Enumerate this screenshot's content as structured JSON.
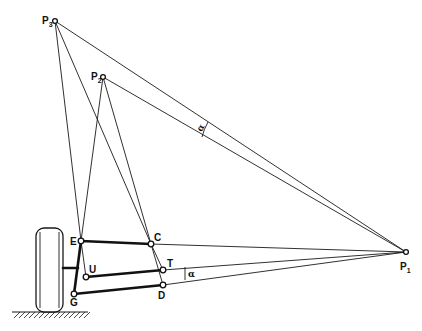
{
  "diagram": {
    "type": "suspension-linkage-geometry",
    "points": {
      "P1": {
        "label": "P",
        "sub": "1",
        "x": 406,
        "y": 252
      },
      "P2": {
        "label": "P",
        "sub": "2",
        "x": 103,
        "y": 77
      },
      "P3": {
        "label": "P",
        "sub": "3",
        "x": 55,
        "y": 21
      },
      "E": {
        "label": "E",
        "x": 81,
        "y": 241
      },
      "C": {
        "label": "C",
        "x": 151,
        "y": 244
      },
      "U": {
        "label": "U",
        "x": 86,
        "y": 277
      },
      "T": {
        "label": "T",
        "x": 163,
        "y": 270
      },
      "G": {
        "label": "G",
        "x": 74,
        "y": 294
      },
      "D": {
        "label": "D",
        "x": 163,
        "y": 285
      }
    },
    "links": [
      {
        "from": "E",
        "to": "C",
        "style": "thick"
      },
      {
        "from": "U",
        "to": "T",
        "style": "thick"
      },
      {
        "from": "G",
        "to": "D",
        "style": "thick"
      },
      {
        "from": "E",
        "to": "G",
        "style": "thick"
      }
    ],
    "construction_lines": [
      {
        "from": "P3",
        "to": "P1"
      },
      {
        "from": "P2",
        "to": "P1"
      },
      {
        "from": "P3",
        "to": "E"
      },
      {
        "from": "P3",
        "to": "C"
      },
      {
        "from": "P2",
        "to": "E"
      },
      {
        "from": "P2",
        "to": "C"
      },
      {
        "from": "C",
        "to": "T"
      },
      {
        "from": "C",
        "to": "D"
      },
      {
        "from": "E",
        "to": "U"
      },
      {
        "from": "C",
        "to": "P1"
      },
      {
        "from": "T",
        "to": "P1"
      },
      {
        "from": "D",
        "to": "P1"
      }
    ],
    "angles": [
      {
        "symbol": "α",
        "name": "upper-angle",
        "x": 205,
        "y": 129
      },
      {
        "symbol": "α",
        "name": "lower-angle",
        "x": 185,
        "y": 274
      }
    ],
    "wheel": {
      "x": 36,
      "y": 228,
      "width": 27,
      "height": 84
    },
    "ground": {
      "y": 312,
      "x1": 12,
      "x2": 88
    }
  }
}
